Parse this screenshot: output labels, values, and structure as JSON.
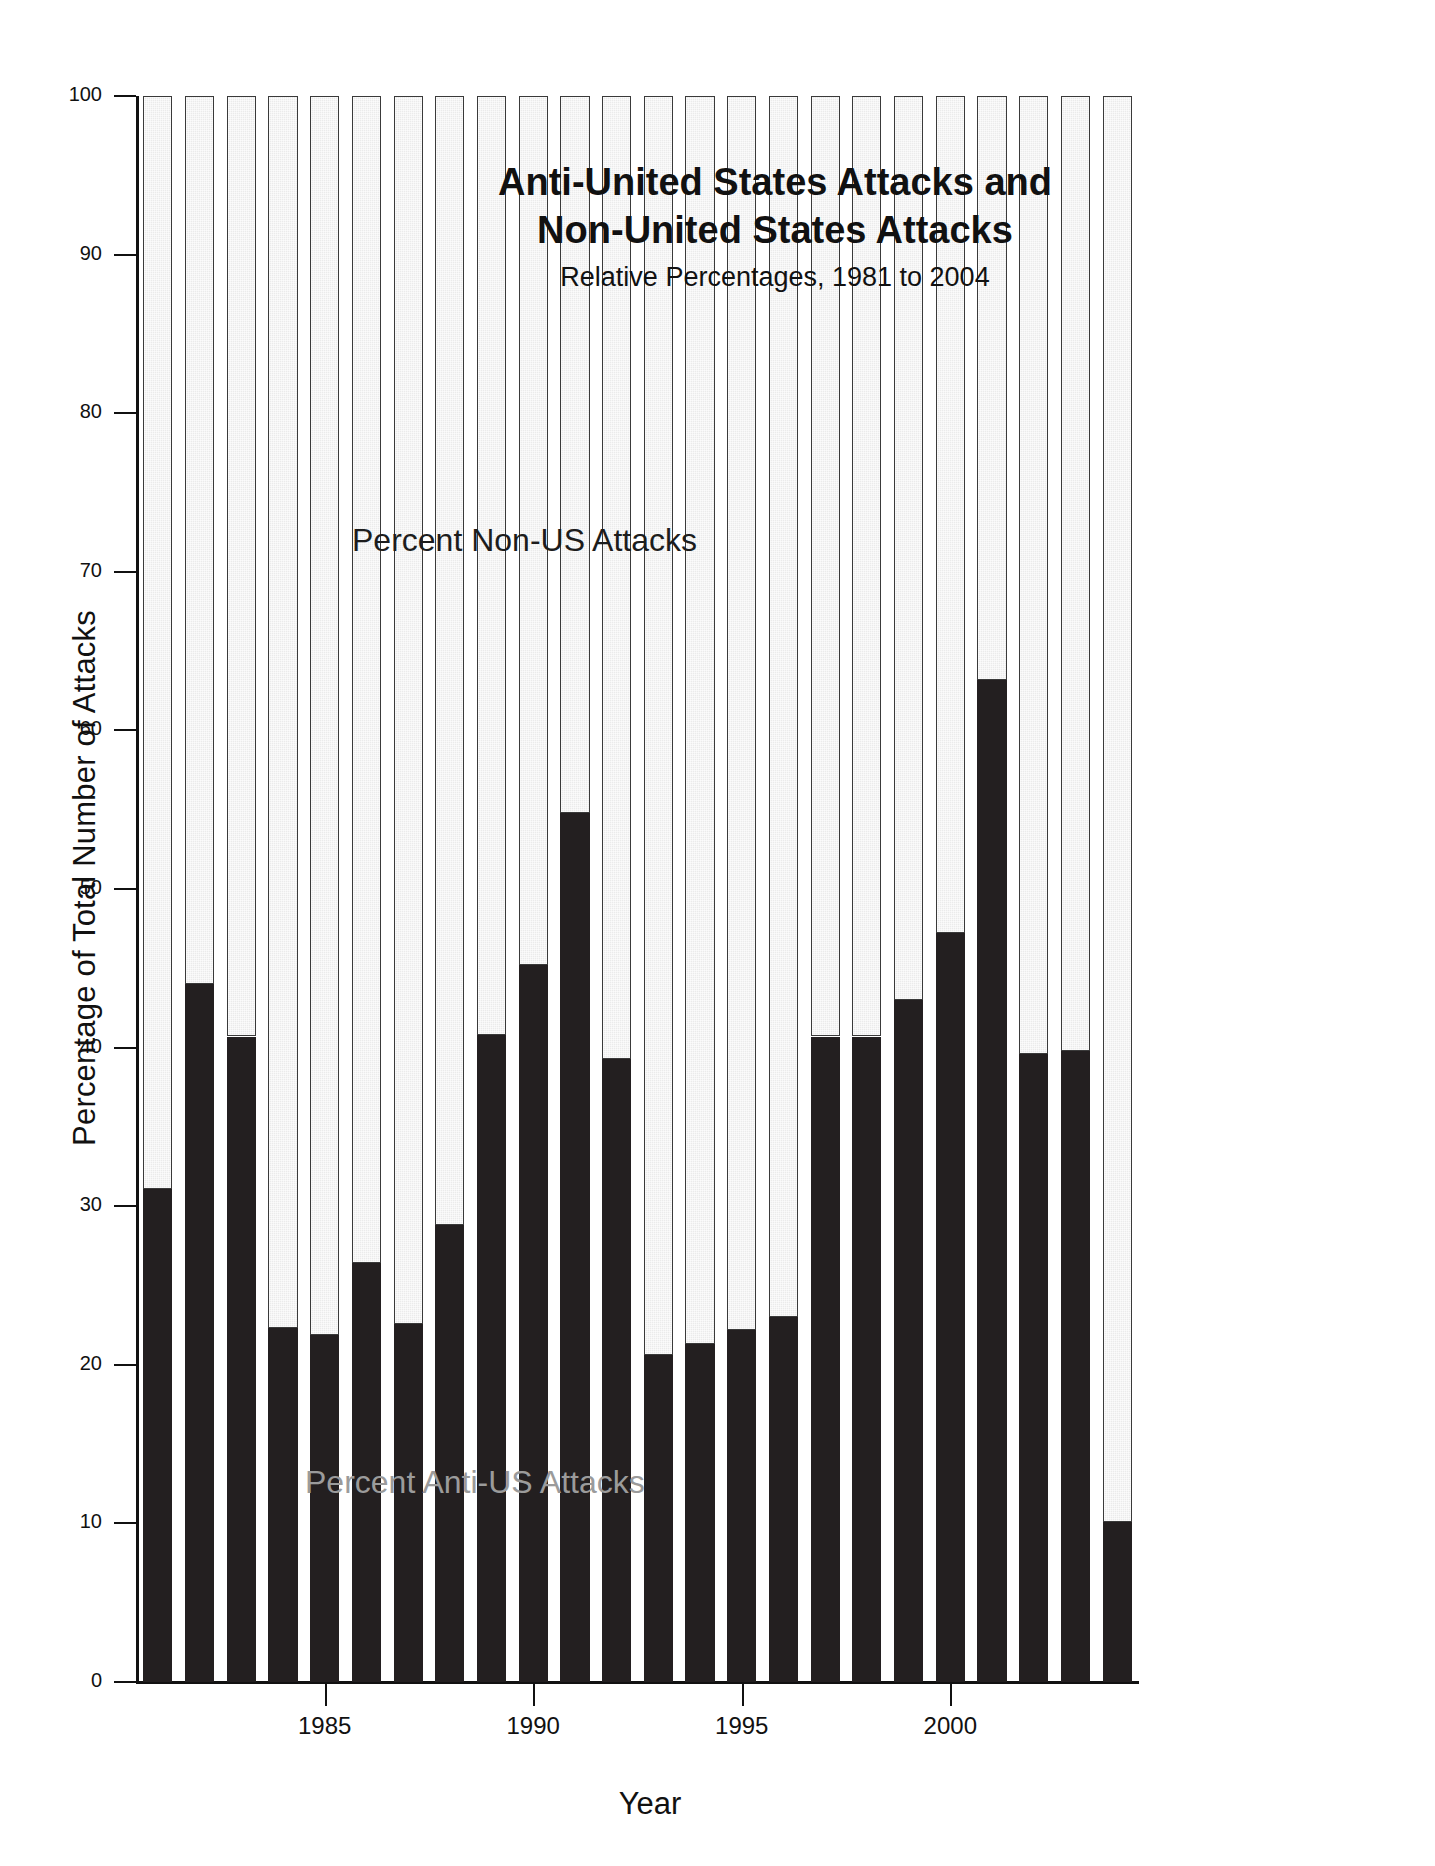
{
  "chart_data": {
    "type": "bar",
    "stacked": true,
    "title": "Anti-United States Attacks and Non-United States Attacks",
    "title_lines": [
      "Anti-United States Attacks and",
      "Non-United States Attacks"
    ],
    "subtitle": "Relative Percentages, 1981 to 2004",
    "xlabel": "Year",
    "ylabel": "Percentage of Total Number of Attacks",
    "ylim": [
      0,
      100
    ],
    "yticks": [
      0,
      10,
      20,
      30,
      40,
      50,
      60,
      70,
      80,
      90,
      100
    ],
    "ytick_labels": [
      "0",
      "10",
      "20",
      "30",
      "40",
      "50",
      "60",
      "70",
      "80",
      "90",
      "100"
    ],
    "xlim": [
      1980.5,
      2004.5
    ],
    "xticks": [
      1985,
      1990,
      1995,
      2000
    ],
    "xtick_labels": [
      "1985",
      "1990",
      "1995",
      "2000"
    ],
    "grid": false,
    "legend_position": "in-plot annotations",
    "categories": [
      1981,
      1982,
      1983,
      1984,
      1985,
      1986,
      1987,
      1988,
      1989,
      1990,
      1991,
      1992,
      1993,
      1994,
      1995,
      1996,
      1997,
      1998,
      1999,
      2000,
      2001,
      2002,
      2003,
      2004
    ],
    "series": [
      {
        "name": "Percent Anti-US Attacks",
        "color": "#231f20",
        "annotation_color": "#9b9b9b",
        "values": [
          31.1,
          44.0,
          40.7,
          22.3,
          21.9,
          26.4,
          22.6,
          28.8,
          40.8,
          45.2,
          54.8,
          39.3,
          20.6,
          21.3,
          22.2,
          23.0,
          40.7,
          40.7,
          43.0,
          47.2,
          63.2,
          39.6,
          39.8,
          10.1
        ]
      },
      {
        "name": "Percent Non-US Attacks",
        "color": "#ebebeb",
        "annotation_color": "#1d1d1d",
        "values": [
          68.9,
          56.0,
          59.3,
          77.7,
          78.1,
          73.6,
          77.4,
          71.2,
          59.2,
          54.8,
          45.2,
          60.7,
          79.4,
          78.7,
          77.8,
          77.0,
          59.3,
          59.3,
          57.0,
          52.8,
          36.8,
          60.4,
          60.2,
          89.9
        ]
      }
    ],
    "annotations": [
      {
        "text": "Percent Non-US Attacks",
        "region": "upper-segment"
      },
      {
        "text": "Percent Anti-US Attacks",
        "region": "lower-segment"
      }
    ]
  }
}
